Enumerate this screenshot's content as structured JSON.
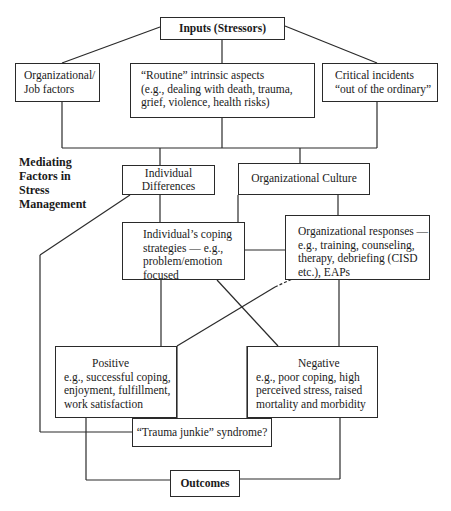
{
  "diagram": {
    "inputs": {
      "title": "Inputs (Stressors)"
    },
    "stressors": [
      {
        "id": "org_job",
        "lines": [
          "Organizational/",
          "Job factors"
        ]
      },
      {
        "id": "routine",
        "lines": [
          "“Routine” intrinsic aspects",
          "(e.g., dealing with death, trauma,",
          "grief, violence, health risks)"
        ]
      },
      {
        "id": "critical",
        "lines": [
          "Critical incidents",
          "“out of the ordinary”"
        ]
      }
    ],
    "mediating_label": [
      "Mediating",
      "Factors in",
      "Stress",
      "Management"
    ],
    "mediators": {
      "individual_differences": "Individual Differences",
      "organizational_culture": "Organizational Culture",
      "coping": [
        "Individual’s coping",
        "strategies — e.g.,",
        "problem/emotion",
        "focused"
      ],
      "org_responses": [
        "Organizational responses —",
        "e.g., training, counseling,",
        "therapy, debriefing (CISD",
        "etc.), EAPs"
      ]
    },
    "outcomes_boxes": {
      "positive": {
        "title": "Positive",
        "lines": [
          "e.g., successful coping,",
          "enjoyment, fulfillment,",
          "work satisfaction"
        ]
      },
      "negative": {
        "title": "Negative",
        "lines": [
          "e.g., poor coping, high",
          "perceived stress, raised",
          "mortality and morbidity"
        ]
      },
      "trauma_junkie": "“Trauma junkie” syndrome?"
    },
    "outcomes": {
      "title": "Outcomes"
    },
    "colors": {
      "stroke": "#2a2a2a",
      "background": "#ffffff",
      "text": "#1a1a1a"
    }
  }
}
